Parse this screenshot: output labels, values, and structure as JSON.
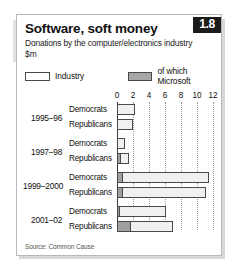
{
  "header": {
    "title": "Software, soft money",
    "subtitle": "Donations by the computer/electronics industry",
    "unit": "$m",
    "badge": "1.8"
  },
  "legend": {
    "industry_label": "Industry",
    "microsoft_label": "of which Microsoft"
  },
  "source": "Source: Common Cause",
  "colors": {
    "industry": "#f0f0f0",
    "microsoft": "#a0a0a0",
    "badge_bg": "#1b1b1b",
    "axis": "#3a3a3a",
    "grid": "#9a9a9a"
  },
  "chart_data": {
    "type": "bar",
    "orientation": "horizontal",
    "title": "Software, soft money",
    "subtitle": "Donations by the computer/electronics industry",
    "xlabel": "$m",
    "ylabel": "",
    "xlim": [
      0,
      12
    ],
    "xticks": [
      0,
      2,
      4,
      6,
      8,
      10,
      12
    ],
    "xtick_labels": [
      "0",
      "2",
      "4",
      "6",
      "8",
      "10",
      "12"
    ],
    "grid": true,
    "legend_position": "top",
    "groups": [
      "1995–96",
      "1997–98",
      "1999–2000",
      "2001–02"
    ],
    "parties": [
      "Democrats",
      "Republicans"
    ],
    "series": [
      {
        "name": "Industry",
        "values": [
          2.3,
          2.0,
          1.0,
          1.45,
          11.5,
          11.1,
          6.1,
          7.0
        ]
      },
      {
        "name": "of which Microsoft",
        "values": [
          0.0,
          0.0,
          0.0,
          0.45,
          0.75,
          0.8,
          0.35,
          1.75
        ]
      }
    ],
    "bars": [
      {
        "group": "1995–96",
        "party": "Democrats",
        "industry": 2.3,
        "microsoft": 0.0
      },
      {
        "group": "1995–96",
        "party": "Republicans",
        "industry": 2.0,
        "microsoft": 0.0
      },
      {
        "group": "1997–98",
        "party": "Democrats",
        "industry": 1.0,
        "microsoft": 0.0
      },
      {
        "group": "1997–98",
        "party": "Republicans",
        "industry": 1.45,
        "microsoft": 0.45
      },
      {
        "group": "1999–2000",
        "party": "Democrats",
        "industry": 11.5,
        "microsoft": 0.75
      },
      {
        "group": "1999–2000",
        "party": "Republicans",
        "industry": 11.1,
        "microsoft": 0.8
      },
      {
        "group": "2001–02",
        "party": "Democrats",
        "industry": 6.1,
        "microsoft": 0.35
      },
      {
        "group": "2001–02",
        "party": "Republicans",
        "industry": 7.0,
        "microsoft": 1.75
      }
    ]
  }
}
